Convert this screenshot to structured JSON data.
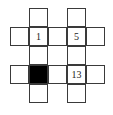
{
  "puzzle": {
    "cell_size_px": 19,
    "rows": 5,
    "cols": 5,
    "colors": {
      "line": "#3a3a3a",
      "fill": "#ffffff",
      "block": "#000000"
    },
    "cells": [
      {
        "r": 0,
        "c": 1,
        "type": "white",
        "label": ""
      },
      {
        "r": 0,
        "c": 3,
        "type": "white",
        "label": ""
      },
      {
        "r": 1,
        "c": 0,
        "type": "white",
        "label": ""
      },
      {
        "r": 1,
        "c": 1,
        "type": "white",
        "label": "1"
      },
      {
        "r": 1,
        "c": 2,
        "type": "white",
        "label": ""
      },
      {
        "r": 1,
        "c": 3,
        "type": "white",
        "label": "5"
      },
      {
        "r": 1,
        "c": 4,
        "type": "white",
        "label": ""
      },
      {
        "r": 2,
        "c": 1,
        "type": "white",
        "label": ""
      },
      {
        "r": 2,
        "c": 3,
        "type": "white",
        "label": ""
      },
      {
        "r": 3,
        "c": 0,
        "type": "white",
        "label": ""
      },
      {
        "r": 3,
        "c": 1,
        "type": "black",
        "label": ""
      },
      {
        "r": 3,
        "c": 2,
        "type": "white",
        "label": ""
      },
      {
        "r": 3,
        "c": 3,
        "type": "white",
        "label": "13"
      },
      {
        "r": 3,
        "c": 4,
        "type": "white",
        "label": ""
      },
      {
        "r": 4,
        "c": 1,
        "type": "white",
        "label": ""
      },
      {
        "r": 4,
        "c": 3,
        "type": "white",
        "label": ""
      }
    ]
  }
}
